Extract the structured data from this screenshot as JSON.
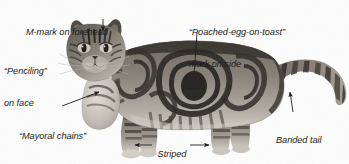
{
  "figure": {
    "kind": "annotated-photograph",
    "palette": {
      "background": "#fefefe",
      "text": "#1c1c1c",
      "leader_line": "#2a2a2a",
      "fur_light": "#b9b3a9",
      "fur_mid": "#7d776f",
      "fur_dark": "#3a3733",
      "fur_darkest": "#1e1c1a"
    }
  },
  "annotations": [
    {
      "id": "m-mark",
      "text": "M-mark on forehead",
      "lines": [
        "M-mark on forehead"
      ],
      "x": 26,
      "y": 6,
      "align": "left",
      "pointer": {
        "type": "arrow",
        "from": [
          103,
          19
        ],
        "to": [
          103,
          31
        ]
      }
    },
    {
      "id": "poached-egg",
      "text": "“Poached-egg-on-toast” mark on side",
      "lines": [
        "“Poached-egg-on-toast”",
        "mark on side"
      ],
      "x": 189,
      "y": 6,
      "align": "left",
      "pointer": {
        "type": "line",
        "from": [
          197,
          32
        ],
        "to": [
          194,
          74
        ]
      }
    },
    {
      "id": "penciling",
      "text": "“Penciling” on face",
      "lines": [
        "“Penciling”",
        "on face"
      ],
      "x": 4,
      "y": 45,
      "align": "left",
      "pointer": null
    },
    {
      "id": "mayoral-chains",
      "text": "“Mayoral chains” on chest",
      "lines": [
        "“Mayoral chains”",
        "on chest"
      ],
      "x": 19,
      "y": 110,
      "align": "left",
      "pointer": {
        "type": "arrow",
        "from": [
          62,
          106
        ],
        "to": [
          100,
          91
        ]
      }
    },
    {
      "id": "striped-legs",
      "text": "Striped legs",
      "lines": [
        "Striped",
        "legs"
      ],
      "x": 155,
      "y": 128,
      "align": "center",
      "pointer": {
        "type": "double-arrow",
        "left": {
          "from": [
            152,
            145
          ],
          "to": [
            134,
            145
          ]
        },
        "right": {
          "from": [
            190,
            145
          ],
          "to": [
            210,
            145
          ]
        }
      }
    },
    {
      "id": "banded-tail",
      "text": "Banded tail",
      "lines": [
        "Banded tail"
      ],
      "x": 276,
      "y": 114,
      "align": "left",
      "pointer": {
        "type": "arrow",
        "from": [
          293,
          112
        ],
        "to": [
          290,
          91
        ]
      }
    }
  ]
}
